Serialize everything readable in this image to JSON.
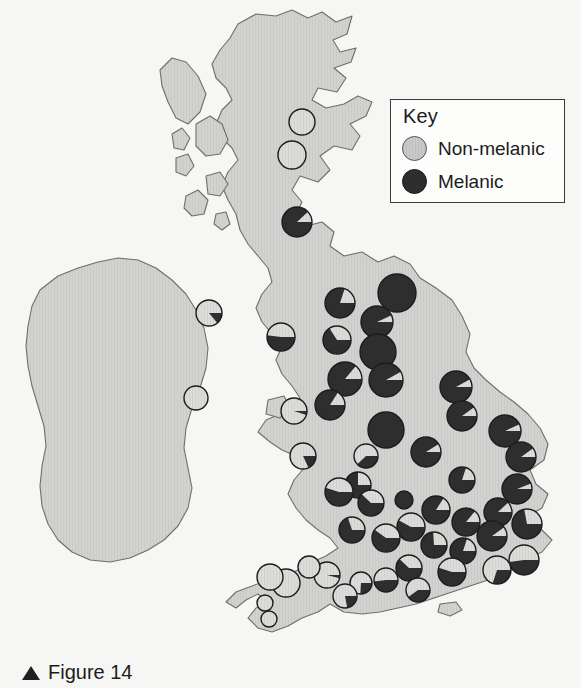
{
  "figure": {
    "caption_marker": "▲",
    "caption_text": "Figure 14"
  },
  "key": {
    "title": "Key",
    "items": [
      {
        "label": "Non-melanic",
        "swatch": "light-grey-circle",
        "color": "#c9c9c9"
      },
      {
        "label": "Melanic",
        "swatch": "dark-circle",
        "color": "#2e2e2e"
      }
    ]
  },
  "colors": {
    "background": "#f1f1ef",
    "sea": "#f7f7f5",
    "land": "#d2d2d0",
    "coastline": "#6e6e6e",
    "melanic": "#2e2e2e",
    "non_melanic": "#d8d8d6",
    "pie_outline": "#1c1c1c",
    "key_border": "#3a3a3a",
    "text": "#1c1c1c"
  },
  "chart_data": {
    "type": "pie",
    "title": "Figure 14",
    "categories": [
      "Melanic",
      "Non-melanic"
    ],
    "legend": [
      "Non-melanic",
      "Melanic"
    ],
    "legend_position": "top-right",
    "value_unit": "percent melanic",
    "sites": [
      {
        "region": "N Scotland",
        "x": 302,
        "y": 122,
        "r": 13,
        "melanic": 0
      },
      {
        "region": "C Scotland",
        "x": 292,
        "y": 155,
        "r": 14,
        "melanic": 0
      },
      {
        "region": "S Scotland",
        "x": 297,
        "y": 222,
        "r": 15,
        "melanic": 88
      },
      {
        "region": "N Ireland",
        "x": 209,
        "y": 313,
        "r": 13,
        "melanic": 14
      },
      {
        "region": "W Ireland",
        "x": 196,
        "y": 398,
        "r": 12,
        "melanic": 0
      },
      {
        "region": "Isle of Man",
        "x": 281,
        "y": 337,
        "r": 14,
        "melanic": 52
      },
      {
        "region": "NW England coast",
        "x": 340,
        "y": 303,
        "r": 15,
        "melanic": 80
      },
      {
        "region": "Cumbria",
        "x": 337,
        "y": 340,
        "r": 14,
        "melanic": 66
      },
      {
        "region": "NE England",
        "x": 397,
        "y": 293,
        "r": 19,
        "melanic": 100
      },
      {
        "region": "Tyne",
        "x": 377,
        "y": 322,
        "r": 16,
        "melanic": 93
      },
      {
        "region": "Yorkshire N",
        "x": 378,
        "y": 352,
        "r": 18,
        "melanic": 100
      },
      {
        "region": "Yorkshire C",
        "x": 386,
        "y": 380,
        "r": 17,
        "melanic": 92
      },
      {
        "region": "Lancashire",
        "x": 345,
        "y": 379,
        "r": 17,
        "melanic": 86
      },
      {
        "region": "Merseyside",
        "x": 330,
        "y": 405,
        "r": 15,
        "melanic": 84
      },
      {
        "region": "N Wales coast",
        "x": 294,
        "y": 411,
        "r": 13,
        "melanic": 5
      },
      {
        "region": "Lincolnshire",
        "x": 456,
        "y": 387,
        "r": 16,
        "melanic": 92
      },
      {
        "region": "Humber",
        "x": 462,
        "y": 416,
        "r": 15,
        "melanic": 90
      },
      {
        "region": "S Yorkshire",
        "x": 386,
        "y": 430,
        "r": 18,
        "melanic": 100
      },
      {
        "region": "Derbyshire",
        "x": 426,
        "y": 452,
        "r": 15,
        "melanic": 91
      },
      {
        "region": "Peak District",
        "x": 366,
        "y": 456,
        "r": 12,
        "melanic": 38
      },
      {
        "region": "Mid Wales",
        "x": 303,
        "y": 456,
        "r": 13,
        "melanic": 18
      },
      {
        "region": "Staffordshire",
        "x": 358,
        "y": 485,
        "r": 13,
        "melanic": 75
      },
      {
        "region": "Shropshire",
        "x": 339,
        "y": 492,
        "r": 14,
        "melanic": 55
      },
      {
        "region": "W Midlands",
        "x": 371,
        "y": 503,
        "r": 13,
        "melanic": 62
      },
      {
        "region": "Leicestershire",
        "x": 404,
        "y": 500,
        "r": 9,
        "melanic": 100
      },
      {
        "region": "Norfolk",
        "x": 505,
        "y": 431,
        "r": 16,
        "melanic": 93
      },
      {
        "region": "Norfolk E",
        "x": 521,
        "y": 457,
        "r": 15,
        "melanic": 90
      },
      {
        "region": "Cambridgeshire",
        "x": 462,
        "y": 480,
        "r": 13,
        "melanic": 80
      },
      {
        "region": "Suffolk",
        "x": 517,
        "y": 489,
        "r": 15,
        "melanic": 94
      },
      {
        "region": "Essex N",
        "x": 498,
        "y": 512,
        "r": 14,
        "melanic": 88
      },
      {
        "region": "Essex",
        "x": 527,
        "y": 524,
        "r": 15,
        "melanic": 72
      },
      {
        "region": "Bedfordshire",
        "x": 436,
        "y": 510,
        "r": 14,
        "melanic": 84
      },
      {
        "region": "Hertfordshire",
        "x": 466,
        "y": 522,
        "r": 14,
        "melanic": 86
      },
      {
        "region": "Greater London",
        "x": 492,
        "y": 536,
        "r": 15,
        "melanic": 90
      },
      {
        "region": "Buckinghamshire",
        "x": 411,
        "y": 527,
        "r": 14,
        "melanic": 58
      },
      {
        "region": "Oxfordshire",
        "x": 386,
        "y": 538,
        "r": 14,
        "melanic": 60
      },
      {
        "region": "Gloucestershire",
        "x": 352,
        "y": 530,
        "r": 13,
        "melanic": 70
      },
      {
        "region": "Berkshire",
        "x": 434,
        "y": 545,
        "r": 13,
        "melanic": 74
      },
      {
        "region": "Surrey",
        "x": 463,
        "y": 551,
        "r": 13,
        "melanic": 80
      },
      {
        "region": "Kent",
        "x": 524,
        "y": 560,
        "r": 15,
        "melanic": 48
      },
      {
        "region": "Sussex",
        "x": 497,
        "y": 570,
        "r": 14,
        "melanic": 30
      },
      {
        "region": "Hampshire",
        "x": 452,
        "y": 572,
        "r": 14,
        "melanic": 55
      },
      {
        "region": "Wiltshire",
        "x": 409,
        "y": 568,
        "r": 13,
        "melanic": 62
      },
      {
        "region": "Somerset",
        "x": 386,
        "y": 580,
        "r": 12,
        "melanic": 48
      },
      {
        "region": "Dorset",
        "x": 418,
        "y": 590,
        "r": 12,
        "melanic": 40
      },
      {
        "region": "Avon",
        "x": 361,
        "y": 583,
        "r": 11,
        "melanic": 26
      },
      {
        "region": "S Somerset",
        "x": 327,
        "y": 575,
        "r": 13,
        "melanic": 4
      },
      {
        "region": "N Devon",
        "x": 309,
        "y": 567,
        "r": 11,
        "melanic": 0
      },
      {
        "region": "Devon",
        "x": 286,
        "y": 583,
        "r": 14,
        "melanic": 0
      },
      {
        "region": "E Cornwall",
        "x": 270,
        "y": 577,
        "r": 13,
        "melanic": 0
      },
      {
        "region": "Cornwall",
        "x": 265,
        "y": 603,
        "r": 8,
        "melanic": 0
      },
      {
        "region": "W Cornwall",
        "x": 269,
        "y": 619,
        "r": 8,
        "melanic": 0
      },
      {
        "region": "S Devon",
        "x": 345,
        "y": 596,
        "r": 12,
        "melanic": 22
      }
    ]
  }
}
